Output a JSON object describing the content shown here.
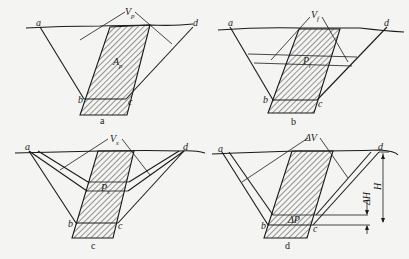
{
  "figure": {
    "panels": [
      {
        "id": "a",
        "caption": "a",
        "points": {
          "a": "a",
          "b": "b",
          "c": "c",
          "d": "d"
        },
        "labels": {
          "top": "V",
          "top_sub": "p",
          "center": "A",
          "center_sub": "p"
        }
      },
      {
        "id": "b",
        "caption": "b",
        "points": {
          "a": "a",
          "b": "b",
          "c": "c",
          "d": "d"
        },
        "labels": {
          "top": "V",
          "top_sub": "f",
          "center": "P",
          "center_sub": "f"
        }
      },
      {
        "id": "c",
        "caption": "c",
        "points": {
          "a": "a",
          "b": "b",
          "c": "c",
          "d": "d"
        },
        "labels": {
          "top": "V",
          "top_sub": "s",
          "center": "P",
          "center_sub": "s"
        }
      },
      {
        "id": "d",
        "caption": "d",
        "points": {
          "a": "a",
          "b": "b",
          "c": "c",
          "d": "d"
        },
        "labels": {
          "top": "ΔV",
          "center": "ΔP",
          "dh": "ΔH",
          "h": "H"
        }
      }
    ]
  }
}
